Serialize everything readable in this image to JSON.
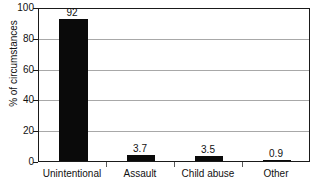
{
  "chart_data": {
    "type": "bar",
    "title": "",
    "subtitle": "",
    "xlabel": "",
    "ylabel": "% of circumstances",
    "categories": [
      "Unintentional",
      "Assault",
      "Child abuse",
      "Other"
    ],
    "values": [
      92,
      3.7,
      3.5,
      0.9
    ],
    "data_labels": [
      "92",
      "3.7",
      "3.5",
      "0.9"
    ],
    "ylim": [
      0,
      100
    ],
    "yticks": [
      0,
      20,
      40,
      60,
      80,
      100
    ],
    "ytick_labels": [
      "0",
      "20",
      "40",
      "60",
      "80",
      "100"
    ],
    "grid": true,
    "grid_axis": "y",
    "legend": false,
    "legend_position": "none",
    "bar_color": "#0a0a0a",
    "grid_color": "#a8a8a8",
    "axis_color": "#1a1a1a",
    "background_color": "#ffffff"
  }
}
